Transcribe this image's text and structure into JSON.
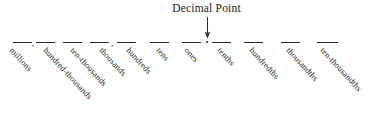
{
  "diagram": {
    "title": "Decimal Point",
    "arrow_icon": "down-arrow-icon",
    "decimal_dot": ".",
    "colors": {
      "ink": "#1f1f1f",
      "rule": "#2b2b2b",
      "background": "#ffffff"
    },
    "group_separators": [
      {
        "symbol": ",",
        "x": 32
      },
      {
        "symbol": ",",
        "x": 111
      }
    ],
    "places": [
      {
        "label": "millions",
        "side": "whole",
        "dash_x": 13,
        "dash_w": 19,
        "label_x": 14
      },
      {
        "label": "hundred-thousands",
        "side": "whole",
        "dash_x": 36,
        "dash_w": 19,
        "label_x": 48
      },
      {
        "label": "ten-thousands",
        "side": "whole",
        "dash_x": 63,
        "dash_w": 19,
        "label_x": 75
      },
      {
        "label": "thousands",
        "side": "whole",
        "dash_x": 90,
        "dash_w": 19,
        "label_x": 104
      },
      {
        "label": "hundreds",
        "side": "whole",
        "dash_x": 117,
        "dash_w": 19,
        "label_x": 131
      },
      {
        "label": "tens",
        "side": "whole",
        "dash_x": 150,
        "dash_w": 19,
        "label_x": 161
      },
      {
        "label": "ones",
        "side": "whole",
        "dash_x": 182,
        "dash_w": 19,
        "label_x": 189
      },
      {
        "label": "tenths",
        "side": "decimal",
        "dash_x": 212,
        "dash_w": 19,
        "label_x": 222
      },
      {
        "label": "hundredths",
        "side": "decimal",
        "dash_x": 244,
        "dash_w": 19,
        "label_x": 254
      },
      {
        "label": "thousandths",
        "side": "decimal",
        "dash_x": 281,
        "dash_w": 19,
        "label_x": 291
      },
      {
        "label": "ten-thousandths",
        "side": "decimal",
        "dash_x": 317,
        "dash_w": 21,
        "label_x": 325
      }
    ]
  }
}
